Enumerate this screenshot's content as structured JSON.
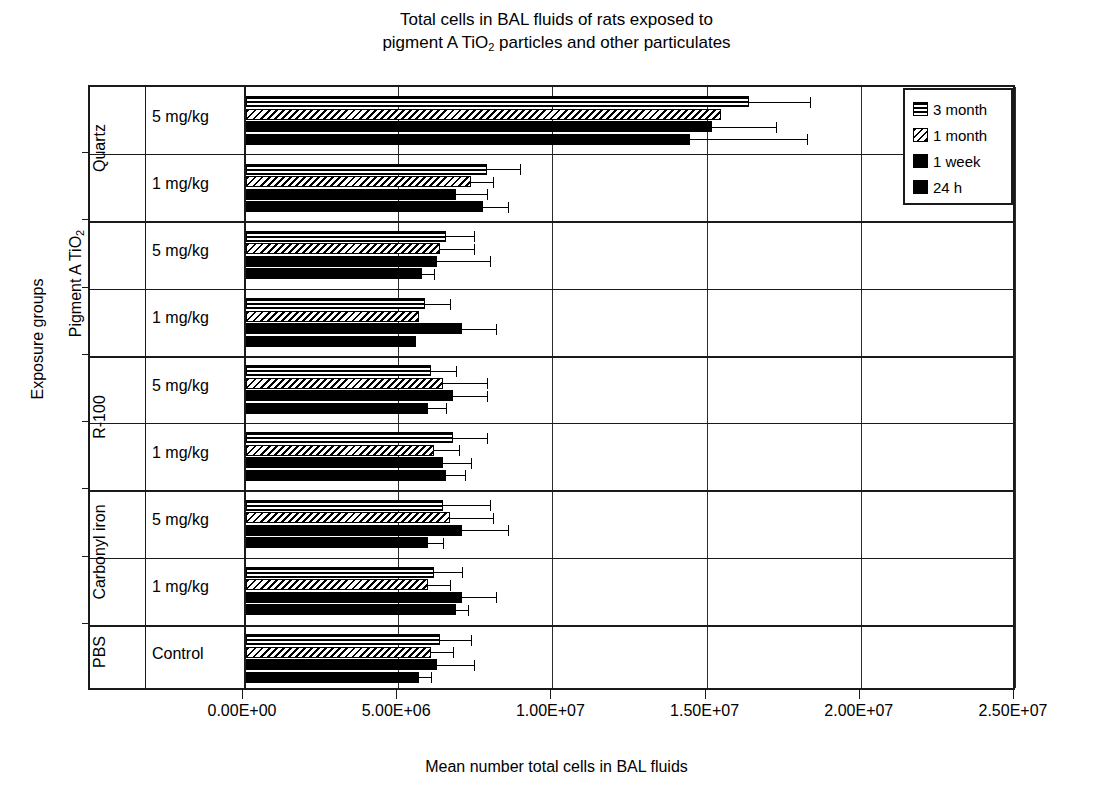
{
  "chart_data": {
    "type": "bar",
    "orientation": "horizontal",
    "title": "Total cells in BAL fluids of rats exposed to pigment A TiO2 particles and other particulates",
    "title_line1": "Total cells in BAL fluids of rats exposed to",
    "title_line2_pre": "pigment A TiO",
    "title_line2_sub": "2",
    "title_line2_post": " particles and other particulates",
    "xlabel": "Mean number total cells in BAL fluids",
    "ylabel": "Exposure groups",
    "xlim": [
      0,
      25000000
    ],
    "xticks": [
      0,
      5000000,
      10000000,
      15000000,
      20000000,
      25000000
    ],
    "xticklabels": [
      "0.00E+00",
      "5.00E+06",
      "1.00E+07",
      "1.50E+07",
      "2.00E+07",
      "2.50E+07"
    ],
    "grid": true,
    "legend_position": "top-right",
    "series": [
      {
        "name": "3 month",
        "pattern": "horizontal-stripes"
      },
      {
        "name": "1 month",
        "pattern": "diagonal-hatch"
      },
      {
        "name": "1 week",
        "pattern": "solid-black"
      },
      {
        "name": "24 h",
        "pattern": "solid-black"
      }
    ],
    "groups": [
      {
        "group": "Quartz",
        "dose": "5 mg/kg"
      },
      {
        "group": "Quartz",
        "dose": "1 mg/kg"
      },
      {
        "group": "Pigment A TiO2",
        "dose": "5 mg/kg"
      },
      {
        "group": "Pigment A TiO2",
        "dose": "1 mg/kg"
      },
      {
        "group": "R-100",
        "dose": "5 mg/kg"
      },
      {
        "group": "R-100",
        "dose": "1 mg/kg"
      },
      {
        "group": "Carbonyl iron",
        "dose": "5 mg/kg"
      },
      {
        "group": "Carbonyl iron",
        "dose": "1 mg/kg"
      },
      {
        "group": "PBS",
        "dose": "Control"
      }
    ],
    "categories": [
      "Quartz 5 mg/kg",
      "Quartz 1 mg/kg",
      "Pigment A TiO2 5 mg/kg",
      "Pigment A TiO2 1 mg/kg",
      "R-100 5 mg/kg",
      "R-100 1 mg/kg",
      "Carbonyl iron 5 mg/kg",
      "Carbonyl iron 1 mg/kg",
      "PBS Control"
    ],
    "values": {
      "3 month": [
        16300000,
        7800000,
        6500000,
        5800000,
        6000000,
        6700000,
        6400000,
        6100000,
        6300000
      ],
      "1 month": [
        15400000,
        7300000,
        6300000,
        5600000,
        6400000,
        6100000,
        6600000,
        5900000,
        6000000
      ],
      "1 week": [
        15100000,
        6800000,
        6200000,
        7000000,
        6700000,
        6400000,
        7000000,
        7000000,
        6200000
      ],
      "24 h": [
        14400000,
        7700000,
        5700000,
        5500000,
        5900000,
        6500000,
        5900000,
        6800000,
        5600000
      ]
    },
    "errors": {
      "3 month": [
        2000000,
        1100000,
        900000,
        800000,
        800000,
        1100000,
        1500000,
        900000,
        1000000
      ],
      "1 month": [
        0,
        700000,
        1100000,
        0,
        1400000,
        800000,
        1400000,
        700000,
        700000
      ],
      "1 week": [
        2100000,
        1000000,
        1700000,
        1100000,
        1100000,
        900000,
        1500000,
        1100000,
        1200000
      ],
      "24 h": [
        3800000,
        800000,
        400000,
        0,
        600000,
        600000,
        500000,
        400000,
        400000
      ]
    },
    "units": "cells"
  },
  "legend": {
    "items": [
      {
        "label": "3 month"
      },
      {
        "label": "1 month"
      },
      {
        "label": "1 week"
      },
      {
        "label": "24 h"
      }
    ]
  },
  "axes": {
    "y_title": "Exposure groups",
    "x_title": "Mean number total cells in BAL fluids",
    "dose_labels": [
      "5 mg/kg",
      "1 mg/kg",
      "5 mg/kg",
      "1 mg/kg",
      "5 mg/kg",
      "1 mg/kg",
      "5 mg/kg",
      "1 mg/kg",
      "Control"
    ],
    "group_labels": [
      {
        "name": "Quartz",
        "sub": ""
      },
      {
        "name": "Pigment A TiO",
        "sub": "2"
      },
      {
        "name": "R-100",
        "sub": ""
      },
      {
        "name": "Carbonyl iron",
        "sub": ""
      },
      {
        "name": "PBS",
        "sub": ""
      }
    ]
  }
}
